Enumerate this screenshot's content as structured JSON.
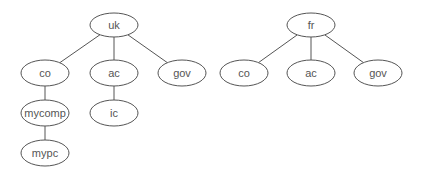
{
  "diagram": {
    "type": "tree",
    "colors": {
      "stroke": "#555555",
      "text": "#555555",
      "fill": "#ffffff"
    },
    "trees": [
      {
        "root": "uk",
        "nodes": [
          {
            "id": "uk",
            "label": "uk",
            "cx": 114,
            "cy": 25,
            "rx": 24,
            "ry": 12
          },
          {
            "id": "uk-co",
            "label": "co",
            "cx": 45,
            "cy": 73,
            "rx": 24,
            "ry": 13
          },
          {
            "id": "uk-ac",
            "label": "ac",
            "cx": 114,
            "cy": 73,
            "rx": 24,
            "ry": 13
          },
          {
            "id": "uk-gov",
            "label": "gov",
            "cx": 182,
            "cy": 73,
            "rx": 24,
            "ry": 13
          },
          {
            "id": "mycomp",
            "label": "mycomp",
            "cx": 45,
            "cy": 113,
            "rx": 24,
            "ry": 13
          },
          {
            "id": "ic",
            "label": "ic",
            "cx": 114,
            "cy": 113,
            "rx": 24,
            "ry": 13
          },
          {
            "id": "mypc",
            "label": "mypc",
            "cx": 45,
            "cy": 153,
            "rx": 24,
            "ry": 13
          }
        ],
        "edges": [
          [
            "uk",
            "uk-co"
          ],
          [
            "uk",
            "uk-ac"
          ],
          [
            "uk",
            "uk-gov"
          ],
          [
            "uk-co",
            "mycomp"
          ],
          [
            "uk-ac",
            "ic"
          ],
          [
            "mycomp",
            "mypc"
          ]
        ]
      },
      {
        "root": "fr",
        "nodes": [
          {
            "id": "fr",
            "label": "fr",
            "cx": 311,
            "cy": 25,
            "rx": 24,
            "ry": 12
          },
          {
            "id": "fr-co",
            "label": "co",
            "cx": 244,
            "cy": 73,
            "rx": 24,
            "ry": 13
          },
          {
            "id": "fr-ac",
            "label": "ac",
            "cx": 311,
            "cy": 73,
            "rx": 24,
            "ry": 13
          },
          {
            "id": "fr-gov",
            "label": "gov",
            "cx": 378,
            "cy": 73,
            "rx": 24,
            "ry": 13
          }
        ],
        "edges": [
          [
            "fr",
            "fr-co"
          ],
          [
            "fr",
            "fr-ac"
          ],
          [
            "fr",
            "fr-gov"
          ]
        ]
      }
    ]
  }
}
